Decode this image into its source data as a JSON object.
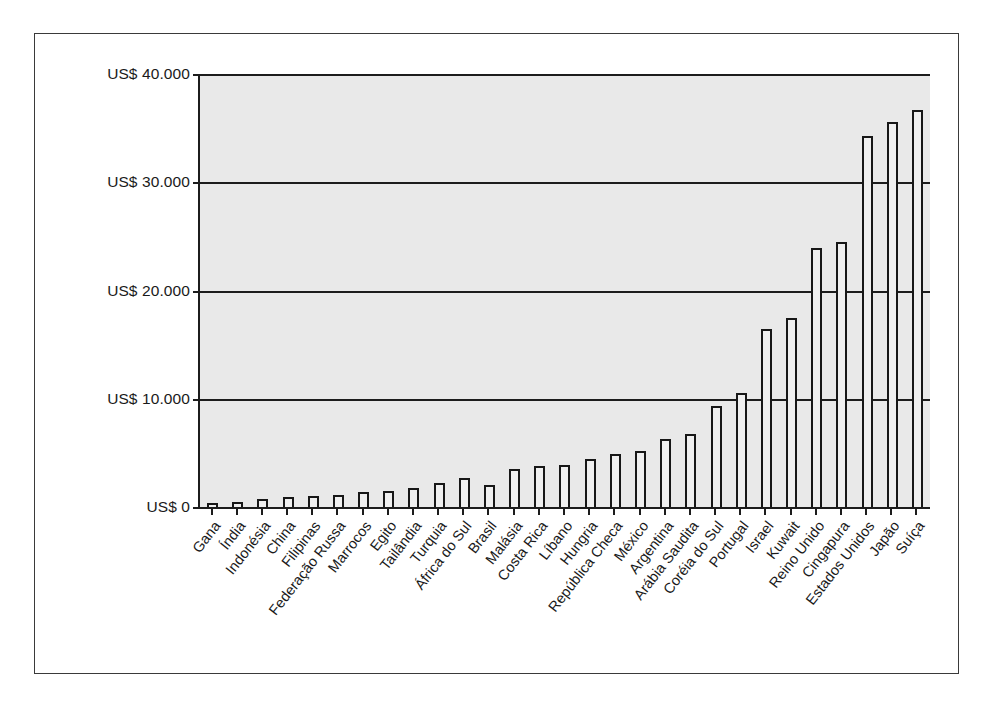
{
  "chart_data": {
    "type": "bar",
    "title": "",
    "subtitle": "",
    "xlabel": "",
    "ylabel": "",
    "ylim": [
      0,
      40000
    ],
    "grid": true,
    "legend": "none",
    "currency_prefix": "US$",
    "ytick_labels": [
      "US$ 40.000",
      "US$ 30.000",
      "US$ 20.000",
      "US$ 10.000",
      "US$ 0"
    ],
    "ytick_values": [
      40000,
      30000,
      20000,
      10000,
      0
    ],
    "categories": [
      "Gana",
      "Índia",
      "Indonésia",
      "China",
      "Filipinas",
      "Federação Russa",
      "Marrocos",
      "Egito",
      "Tailândia",
      "Turquia",
      "África do Sul",
      "Brasil",
      "Malásia",
      "Costa Rica",
      "Líbano",
      "Hungria",
      "República Checa",
      "México",
      "Argentina",
      "Arábia Saudita",
      "Coréia do Sul",
      "Portugal",
      "Israel",
      "Kuwait",
      "Reino Unido",
      "Cingapura",
      "Estados Unidos",
      "Japão",
      "Suíça"
    ],
    "values": [
      400,
      500,
      700,
      900,
      1000,
      1100,
      1400,
      1500,
      1800,
      2200,
      2700,
      2000,
      3500,
      3800,
      3900,
      4400,
      4900,
      5200,
      6300,
      6700,
      9300,
      10500,
      16400,
      17500,
      23900,
      24500,
      34300,
      35600,
      36700
    ]
  }
}
